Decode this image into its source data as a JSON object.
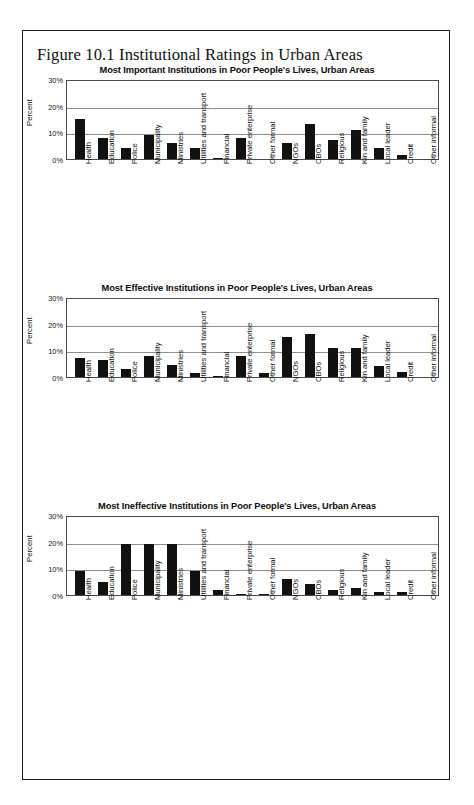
{
  "figure": {
    "caption": "Figure 10.1 Institutional Ratings in Urban Areas"
  },
  "axis": {
    "ylabel": "Percent",
    "yticks": [
      "30%",
      "20%",
      "10%",
      "0%"
    ]
  },
  "chart_data": [
    {
      "type": "bar",
      "title": "Most Important Institutions in Poor People's Lives, Urban Areas",
      "xlabel": "",
      "ylabel": "Percent",
      "ylim": [
        0,
        30
      ],
      "grid": true,
      "legend": "none",
      "categories": [
        "Health",
        "Education",
        "Police",
        "Municipality",
        "Ministries",
        "Utilities and transport",
        "Financial",
        "Private enterprise",
        "Other formal",
        "NGOs",
        "CBOs",
        "Religious",
        "Kin and family",
        "Local leader",
        "Credit",
        "Other informal"
      ],
      "values": [
        15,
        8,
        4,
        9,
        6,
        4,
        0.5,
        8,
        0,
        6,
        13,
        7,
        11,
        4,
        1.5,
        0
      ]
    },
    {
      "type": "bar",
      "title": "Most Effective Institutions in Poor People's Lives, Urban Areas",
      "xlabel": "",
      "ylabel": "Percent",
      "ylim": [
        0,
        30
      ],
      "grid": true,
      "legend": "none",
      "categories": [
        "Health",
        "Education",
        "Police",
        "Municipality",
        "Ministries",
        "Utilities and transport",
        "Financial",
        "Private enterprise",
        "Other formal",
        "NGOs",
        "CBOs",
        "Religious",
        "Kin and family",
        "Local leader",
        "Credit",
        "Other informal"
      ],
      "values": [
        7,
        6.5,
        3,
        8,
        4.5,
        1.5,
        0.5,
        8,
        1.5,
        15,
        16,
        11,
        11,
        4,
        2,
        0
      ]
    },
    {
      "type": "bar",
      "title": "Most Ineffective Institutions in Poor People's Lives, Urban Areas",
      "xlabel": "",
      "ylabel": "Percent",
      "ylim": [
        0,
        30
      ],
      "grid": true,
      "legend": "none",
      "categories": [
        "Health",
        "Education",
        "Police",
        "Municipality",
        "Ministries",
        "Utilities and transport",
        "Financial",
        "Private enterprise",
        "Other formal",
        "NGOs",
        "CBOs",
        "Religious",
        "Kin and family",
        "Local leader",
        "Credit",
        "Other informal"
      ],
      "values": [
        9,
        5,
        19,
        19,
        19,
        9,
        2,
        0.5,
        0.5,
        6,
        4,
        2,
        2.5,
        1,
        1,
        0
      ]
    }
  ]
}
